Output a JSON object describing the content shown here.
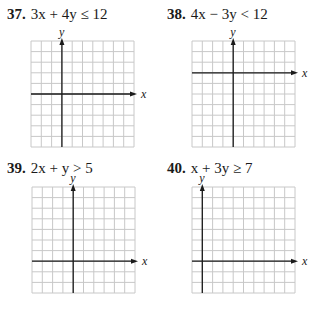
{
  "problems": [
    {
      "number": "37.",
      "inequality": "3x + 4y ≤ 12",
      "x_label": "x",
      "y_label": "y",
      "grid": {
        "columns": 10,
        "rows": 10,
        "y_axis_col": 3,
        "x_axis_row": 5
      }
    },
    {
      "number": "38.",
      "inequality": "4x − 3y < 12",
      "x_label": "x",
      "y_label": "y",
      "grid": {
        "columns": 10,
        "rows": 10,
        "y_axis_col": 4,
        "x_axis_row": 3
      }
    },
    {
      "number": "39.",
      "inequality": "2x + y > 5",
      "x_label": "x",
      "y_label": "y",
      "grid": {
        "columns": 10,
        "rows": 10,
        "y_axis_col": 4,
        "x_axis_row": 7
      }
    },
    {
      "number": "40.",
      "inequality": "x + 3y ≥ 7",
      "x_label": "x",
      "y_label": "y",
      "grid": {
        "columns": 10,
        "rows": 10,
        "y_axis_col": 1,
        "x_axis_row": 7
      }
    }
  ],
  "colors": {
    "grid_line": "#c8c8c8",
    "axis": "#1a1a1a"
  }
}
